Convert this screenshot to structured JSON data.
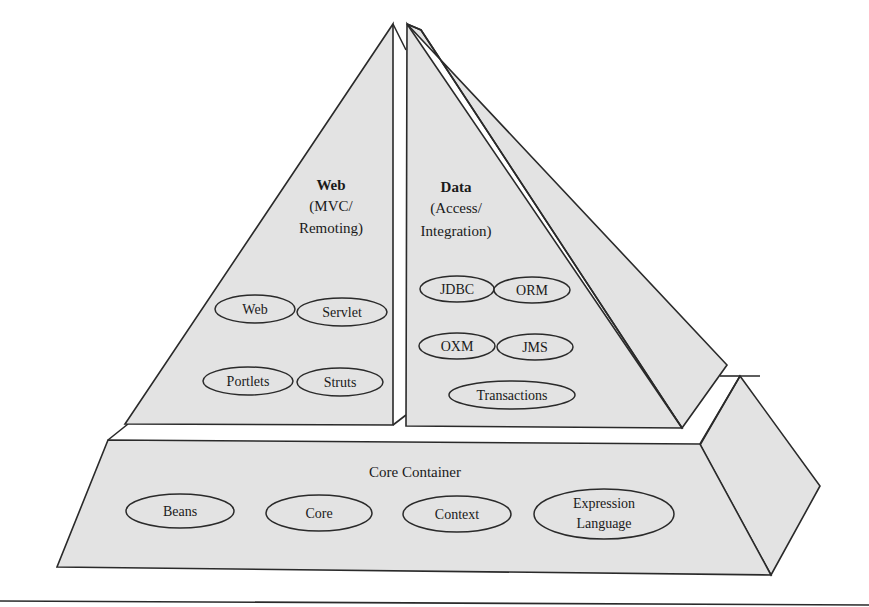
{
  "diagram": {
    "web_layer": {
      "title": "Web",
      "subtitle_line1": "(MVC/",
      "subtitle_line2": "Remoting)",
      "modules": [
        "Web",
        "Servlet",
        "Portlets",
        "Struts"
      ]
    },
    "data_layer": {
      "title": "Data",
      "subtitle_line1": "(Access/",
      "subtitle_line2": "Integration)",
      "modules": [
        "JDBC",
        "ORM",
        "OXM",
        "JMS",
        "Transactions"
      ]
    },
    "core_layer": {
      "title": "Core Container",
      "modules": [
        "Beans",
        "Core",
        "Context"
      ],
      "expression_language_line1": "Expression",
      "expression_language_line2": "Language"
    }
  },
  "colors": {
    "face_fill": "#e3e3e3",
    "stroke": "#2a2a2a",
    "background": "#ffffff"
  }
}
